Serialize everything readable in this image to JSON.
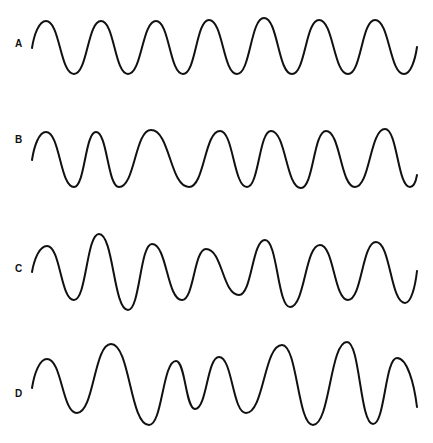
{
  "figure": {
    "background": "#ffffff",
    "stroke_color": "#111111",
    "waves": [
      {
        "label": "A",
        "label_pos": [
          15,
          39
        ],
        "description": "regular sine wave, constant amplitude and frequency",
        "points": [
          [
            32,
            48
          ],
          [
            46,
            21
          ],
          [
            74,
            74
          ],
          [
            101,
            21
          ],
          [
            128,
            74
          ],
          [
            156,
            21
          ],
          [
            183,
            74
          ],
          [
            209,
            20
          ],
          [
            237,
            74
          ],
          [
            264,
            18
          ],
          [
            292,
            74
          ],
          [
            319,
            20
          ],
          [
            348,
            74
          ],
          [
            375,
            20
          ],
          [
            404,
            74
          ],
          [
            417,
            47
          ]
        ]
      },
      {
        "label": "B",
        "label_pos": [
          15,
          135
        ],
        "description": "constant amplitude, varying frequency",
        "points": [
          [
            32,
            160
          ],
          [
            46,
            132
          ],
          [
            74,
            187
          ],
          [
            96,
            132
          ],
          [
            119,
            187
          ],
          [
            151,
            130
          ],
          [
            189,
            187
          ],
          [
            220,
            131
          ],
          [
            247,
            187
          ],
          [
            271,
            131
          ],
          [
            301,
            188
          ],
          [
            326,
            131
          ],
          [
            355,
            187
          ],
          [
            385,
            129
          ],
          [
            410,
            187
          ],
          [
            417,
            175
          ]
        ]
      },
      {
        "label": "C",
        "label_pos": [
          15,
          264
        ],
        "description": "constant frequency, varying amplitude",
        "points": [
          [
            32,
            272
          ],
          [
            47,
            246
          ],
          [
            74,
            300
          ],
          [
            99,
            234
          ],
          [
            128,
            310
          ],
          [
            152,
            244
          ],
          [
            182,
            300
          ],
          [
            206,
            249
          ],
          [
            239,
            295
          ],
          [
            265,
            240
          ],
          [
            290,
            307
          ],
          [
            320,
            245
          ],
          [
            348,
            300
          ],
          [
            376,
            242
          ],
          [
            405,
            303
          ],
          [
            417,
            271
          ]
        ]
      },
      {
        "label": "D",
        "label_pos": [
          15,
          389
        ],
        "description": "varying amplitude and varying frequency",
        "points": [
          [
            32,
            388
          ],
          [
            47,
            359
          ],
          [
            77,
            413
          ],
          [
            111,
            344
          ],
          [
            149,
            425
          ],
          [
            176,
            361
          ],
          [
            195,
            409
          ],
          [
            219,
            357
          ],
          [
            246,
            413
          ],
          [
            282,
            345
          ],
          [
            313,
            425
          ],
          [
            347,
            342
          ],
          [
            373,
            424
          ],
          [
            397,
            358
          ],
          [
            417,
            407
          ]
        ]
      }
    ]
  }
}
